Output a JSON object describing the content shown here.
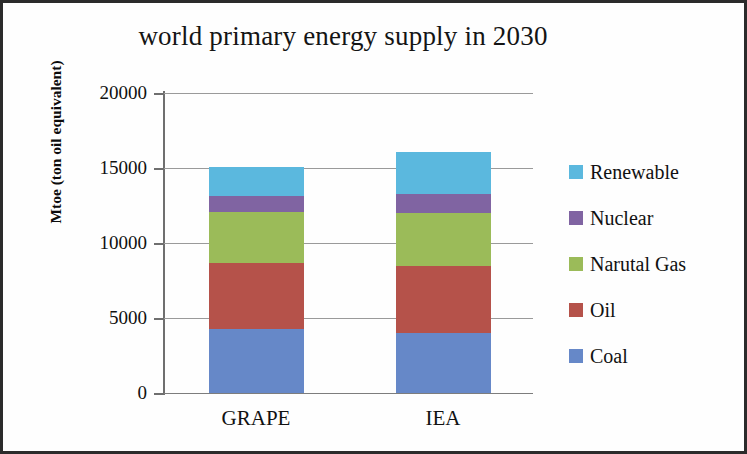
{
  "chart_data": {
    "type": "bar",
    "stacked": true,
    "title": "world primary energy supply in 2030",
    "xlabel": "",
    "ylabel": "Mtoe (ton oil equivalent)",
    "categories": [
      "GRAPE",
      "IEA"
    ],
    "ylim": [
      0,
      20000
    ],
    "y_ticks": [
      "0",
      "5000",
      "10000",
      "15000",
      "20000"
    ],
    "y_tick_values": [
      0,
      5000,
      10000,
      15000,
      20000
    ],
    "grid": true,
    "legend_position": "right",
    "series": [
      {
        "name": "Coal",
        "color": "#6688C8",
        "values": [
          4250,
          4000
        ]
      },
      {
        "name": "Oil",
        "color": "#B5524A",
        "values": [
          4450,
          4450
        ]
      },
      {
        "name": "Narutal Gas",
        "color": "#9BBB59",
        "values": [
          3400,
          3550
        ]
      },
      {
        "name": "Nuclear",
        "color": "#8064A2",
        "values": [
          1050,
          1300
        ]
      },
      {
        "name": "Renewable",
        "color": "#5BB8DE",
        "values": [
          1950,
          2750
        ]
      }
    ],
    "totals": [
      15100,
      16050
    ],
    "legend_order": [
      "Renewable",
      "Nuclear",
      "Narutal Gas",
      "Oil",
      "Coal"
    ]
  },
  "colors": {
    "axis": "#6f6f6f",
    "gridline": "#9a9a9a",
    "text": "#111111",
    "frame": "#2b2b2b",
    "background": "#fefefe"
  }
}
